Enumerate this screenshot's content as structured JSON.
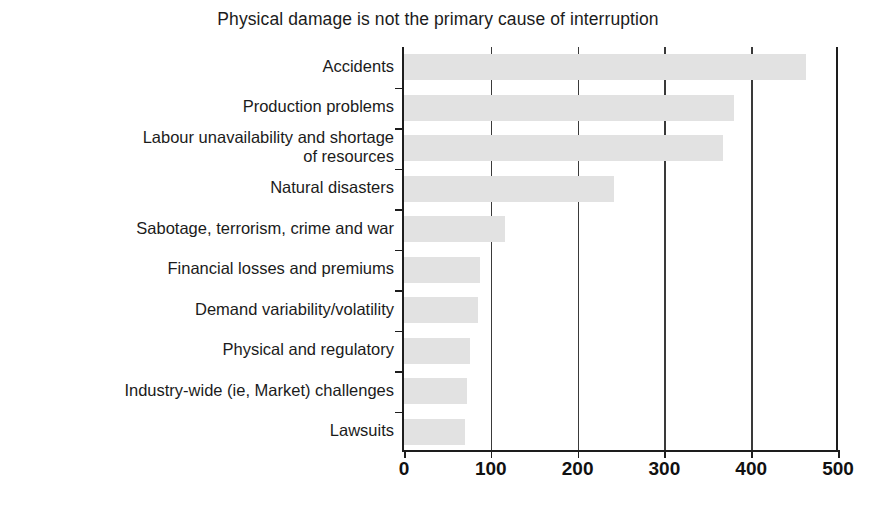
{
  "chart_data": {
    "type": "bar",
    "orientation": "horizontal",
    "title": "Physical damage is not the primary cause of interruption",
    "xlabel": "",
    "ylabel": "",
    "xlim": [
      0,
      500
    ],
    "xticks": [
      "0",
      "100",
      "200",
      "300",
      "400",
      "500"
    ],
    "grid": "vertical gridlines at 100, 200, 300, 400",
    "legend": "none",
    "bar_color": "#e2e2e2",
    "categories": [
      "Accidents",
      "Production problems",
      "Labour unavailability and shortage\nof resources",
      "Natural disasters",
      "Sabotage, terrorism, crime and war",
      "Financial losses and premiums",
      "Demand variability/volatility",
      "Physical and regulatory",
      "Industry-wide (ie, Market) challenges",
      "Lawsuits"
    ],
    "values": [
      463,
      380,
      367,
      242,
      116,
      87,
      85,
      76,
      73,
      70
    ]
  },
  "colors": {
    "bar": "#e2e2e2",
    "axis": "#1d1d1d",
    "grid": "#3a3a3a",
    "text": "#1b1b1b",
    "background": "#ffffff"
  }
}
